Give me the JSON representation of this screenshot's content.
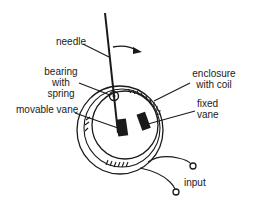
{
  "diagram": {
    "type": "moving-iron meter schematic",
    "labels": {
      "needle": "needle",
      "bearing_line1": "bearing",
      "bearing_line2": "with",
      "bearing_line3": "spring",
      "movable_vane": "movable vane",
      "enclosure_line1": "enclosure",
      "enclosure_line2": "with coil",
      "fixed_line1": "fixed",
      "fixed_line2": "vane",
      "input": "input"
    },
    "colors": {
      "ink": "#1a1a1a",
      "background": "#ffffff"
    }
  }
}
